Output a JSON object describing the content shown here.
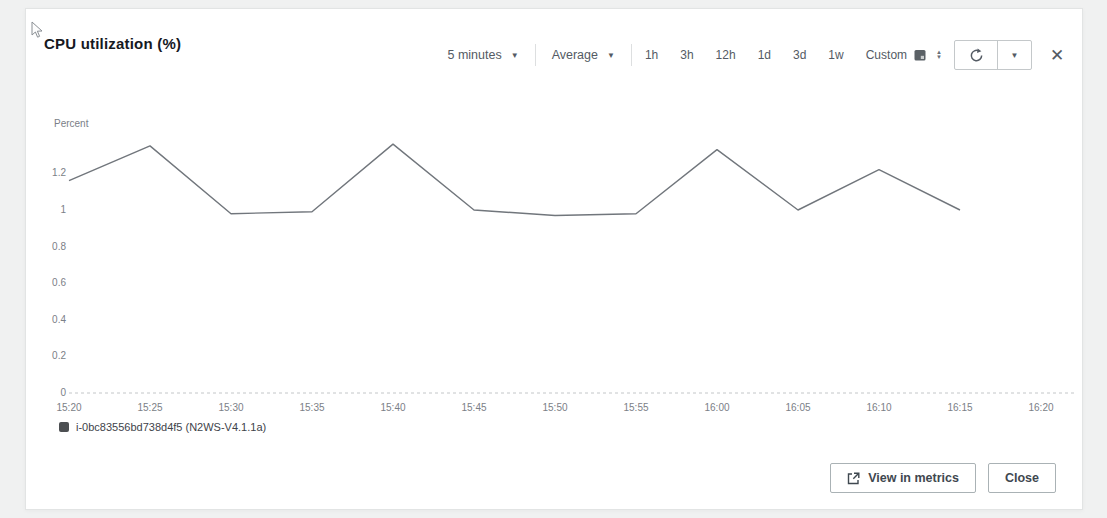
{
  "dialog": {
    "title": "CPU utilization (%)"
  },
  "toolbar": {
    "period_select": {
      "value": "5 minutes"
    },
    "statistic_select": {
      "value": "Average"
    },
    "ranges": [
      "1h",
      "3h",
      "12h",
      "1d",
      "3d",
      "1w"
    ],
    "custom_label": "Custom"
  },
  "chart_data": {
    "type": "line",
    "title": "CPU utilization (%)",
    "ylabel": "Percent",
    "xlabel": "",
    "ylim": [
      0,
      1.4
    ],
    "grid": "baseline-only",
    "legend_position": "bottom-left",
    "line_color": "#71767c",
    "x_labels": [
      "15:20",
      "15:25",
      "15:30",
      "15:35",
      "15:40",
      "15:45",
      "15:50",
      "15:55",
      "16:00",
      "16:05",
      "16:10",
      "16:15",
      "16:20"
    ],
    "y_ticks": [
      "1.2",
      "1",
      "0.8",
      "0.6",
      "0.4",
      "0.2",
      "0"
    ],
    "series": [
      {
        "name": "i-0bc83556bd738d4f5 (N2WS-V4.1.1a)",
        "x": [
          "15:20",
          "15:25",
          "15:30",
          "15:35",
          "15:40",
          "15:45",
          "15:50",
          "15:55",
          "16:00",
          "16:05",
          "16:10",
          "16:15"
        ],
        "values": [
          1.16,
          1.35,
          0.98,
          0.99,
          1.36,
          1.0,
          0.97,
          0.98,
          1.33,
          1.0,
          1.22,
          1.0
        ]
      }
    ]
  },
  "legend": {
    "series_label": "i-0bc83556bd738d4f5 (N2WS-V4.1.1a)",
    "marker_color": "#4c4f52"
  },
  "footer": {
    "view_in_metrics_label": "View in metrics",
    "close_label": "Close"
  }
}
